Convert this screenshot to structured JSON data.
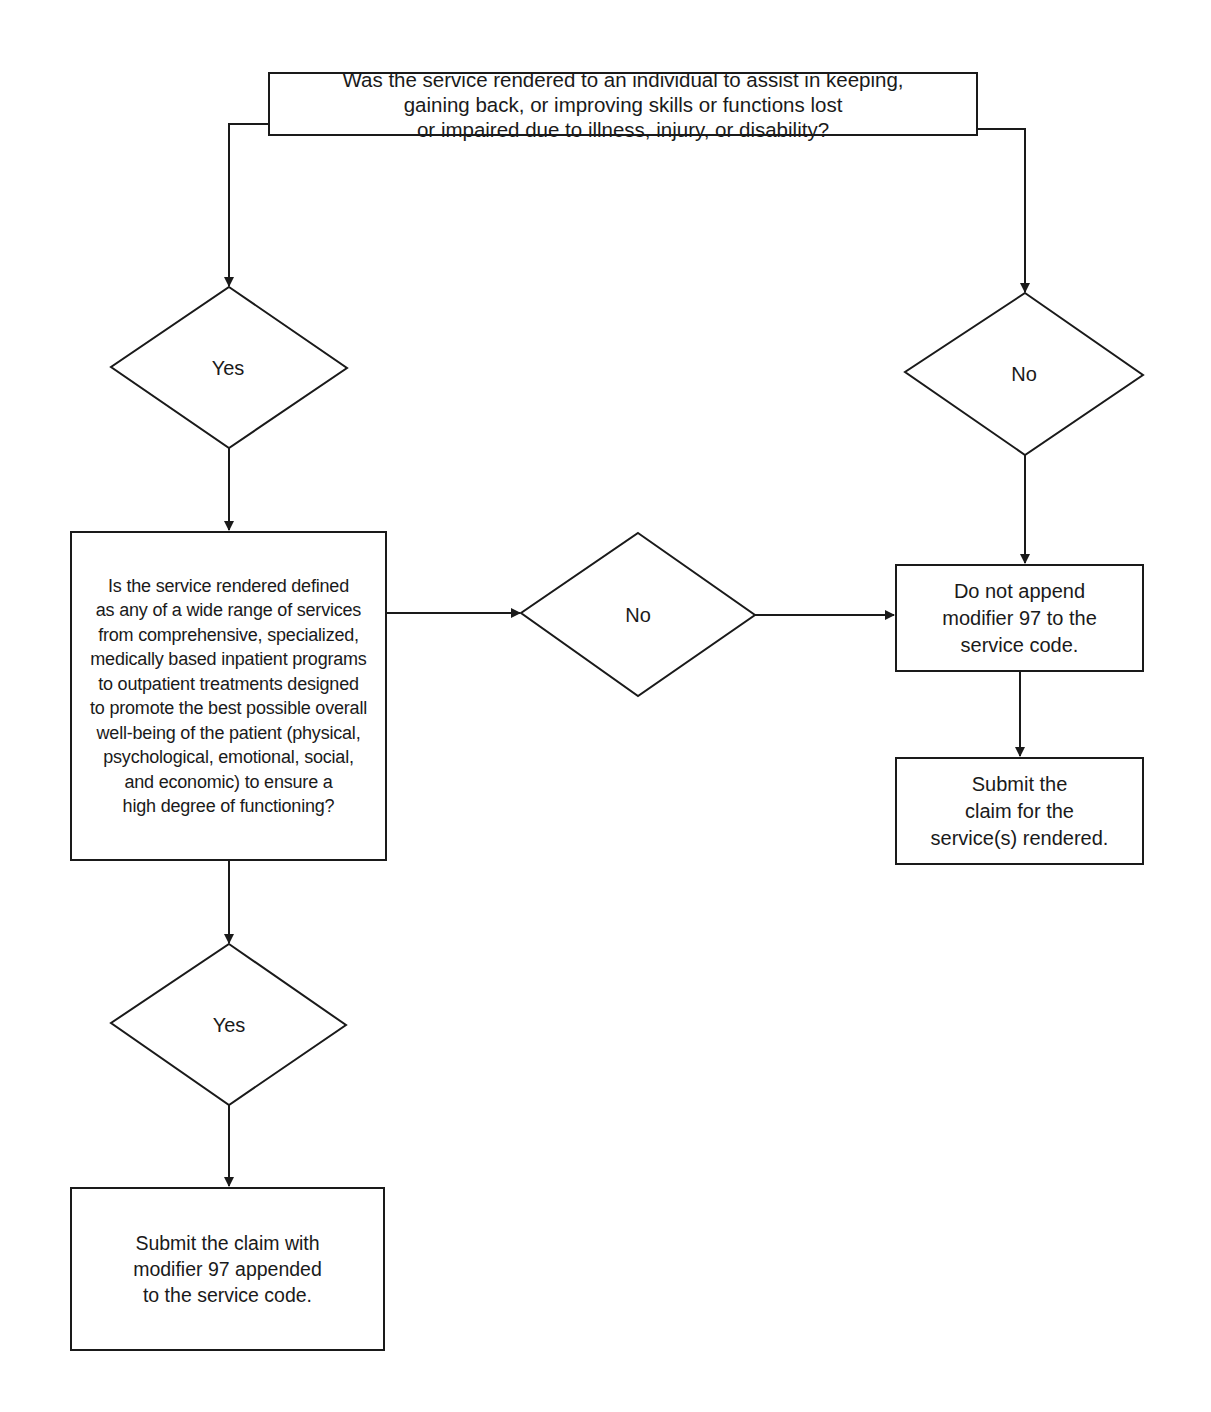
{
  "flowchart": {
    "start": {
      "text": "Was the service rendered to an individual to assist in keeping,\ngaining back, or improving skills or functions lost\nor impaired due to illness, injury, or disability?"
    },
    "decision_yes_1": {
      "label": "Yes"
    },
    "decision_no_1": {
      "label": "No"
    },
    "question": {
      "text": "Is the service rendered defined\nas any of a wide range of services\nfrom comprehensive, specialized,\nmedically based inpatient programs\nto outpatient treatments designed\nto promote the best possible overall\nwell-being of the patient (physical,\npsychological, emotional, social,\nand economic) to ensure a\nhigh degree of functioning?"
    },
    "decision_no_2": {
      "label": "No"
    },
    "decision_yes_2": {
      "label": "Yes"
    },
    "do_not_append": {
      "text": "Do not append\nmodifier 97 to the\nservice code."
    },
    "submit_claim_plain": {
      "text": "Submit the\nclaim for the\nservice(s) rendered."
    },
    "submit_claim_modifier": {
      "text": "Submit the claim with\nmodifier 97 appended\nto the service code."
    }
  },
  "colors": {
    "stroke": "#1a1a1a",
    "background": "#ffffff"
  }
}
